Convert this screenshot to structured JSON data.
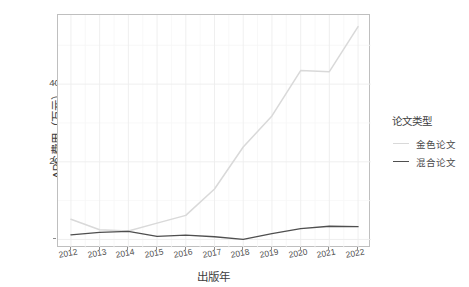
{
  "chart_data": {
    "type": "line",
    "title": "",
    "xlabel": "出版年",
    "ylabel": "APC费用（万元）",
    "x": [
      2012,
      2013,
      2014,
      2015,
      2016,
      2017,
      2018,
      2019,
      2020,
      2021,
      2022
    ],
    "categories": [
      "2012",
      "2013",
      "2014",
      "2015",
      "2016",
      "2017",
      "2018",
      "2019",
      "2020",
      "2021",
      "2022"
    ],
    "series": [
      {
        "name": "金色论文",
        "color": "#d9d9d9",
        "values": [
          52,
          25,
          22,
          42,
          62,
          130,
          238,
          318,
          435,
          432,
          548
        ]
      },
      {
        "name": "混合论文",
        "color": "#4f4f4f",
        "values": [
          12,
          18,
          21,
          8,
          11,
          7,
          0,
          15,
          28,
          34,
          33
        ]
      }
    ],
    "xlim": [
      2011.55,
      2022.45
    ],
    "ylim": [
      -22,
      578
    ],
    "yticks": [
      0,
      200,
      400
    ],
    "ytick_labels": [
      "0",
      "200",
      "400"
    ],
    "grid": true,
    "legend_position": "right"
  },
  "legend": {
    "title": "论文类型",
    "entries": [
      {
        "label": "金色论文",
        "color": "#d9d9d9"
      },
      {
        "label": "混合论文",
        "color": "#4f4f4f"
      }
    ]
  },
  "axes": {
    "x_title": "出版年",
    "y_title": "APC费用（万元）",
    "y_ticks": [
      "0",
      "200",
      "400"
    ],
    "x_ticks": [
      "2012",
      "2013",
      "2014",
      "2015",
      "2016",
      "2017",
      "2018",
      "2019",
      "2020",
      "2021",
      "2022"
    ]
  },
  "style": {
    "panel_background": "#ffffff",
    "panel_border": "#bfbfbf",
    "grid_major": "#ededed",
    "grid_minor": "#f6f6f6",
    "text_color": "#4d4d4d"
  }
}
